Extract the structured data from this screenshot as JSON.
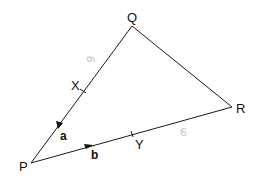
{
  "diagram": {
    "type": "vector-triangle",
    "points": {
      "P": {
        "label": "P",
        "x": 31,
        "y": 163
      },
      "Q": {
        "label": "Q",
        "x": 132,
        "y": 26
      },
      "R": {
        "label": "R",
        "x": 232,
        "y": 107
      }
    },
    "midpoints": {
      "X": {
        "label": "X",
        "on_side": "PQ"
      },
      "Y": {
        "label": "Y",
        "on_side": "PR"
      }
    },
    "vectors": {
      "a": {
        "label": "a",
        "side": "QP",
        "direction": "toward P"
      },
      "b": {
        "label": "b",
        "side": "PR",
        "direction": "toward R"
      }
    },
    "annotations": [
      {
        "text": "9",
        "near": "QX",
        "style": "faint"
      },
      {
        "text": "6",
        "near": "YR",
        "style": "faint"
      }
    ],
    "colors": {
      "line": "#1a1a1a",
      "text": "#111111",
      "faint": "#c8c8c8"
    }
  }
}
